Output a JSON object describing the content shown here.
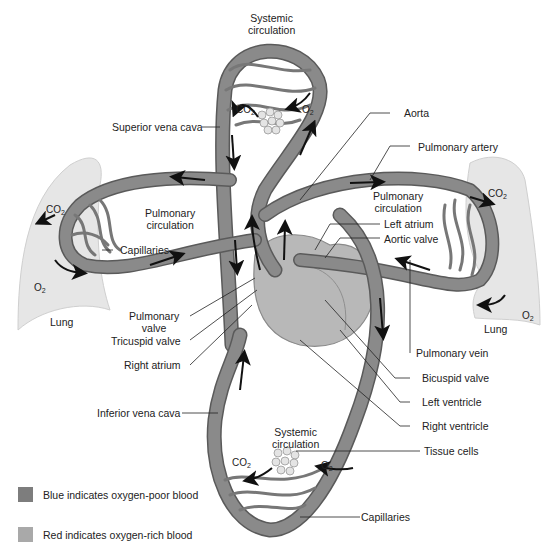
{
  "labels": {
    "systemic_top": [
      "Systemic",
      "circulation"
    ],
    "systemic_bottom": [
      "Systemic",
      "circulation"
    ],
    "pulmonary_left": [
      "Pulmonary",
      "circulation"
    ],
    "pulmonary_right": [
      "Pulmonary",
      "circulation"
    ],
    "superior_vena_cava": "Superior vena cava",
    "aorta": "Aorta",
    "pulmonary_artery": "Pulmonary artery",
    "capillaries_lung": "Capillaries",
    "left_atrium": "Left atrium",
    "aortic_valve": "Aortic valve",
    "pulmonary_valve": [
      "Pulmonary",
      "valve"
    ],
    "tricuspid_valve": "Tricuspid valve",
    "right_atrium": "Right atrium",
    "pulmonary_vein": "Pulmonary vein",
    "bicuspid_valve": "Bicuspid valve",
    "left_ventricle": "Left ventricle",
    "right_ventricle": "Right ventricle",
    "inferior_vena_cava": "Inferior vena cava",
    "tissue_cells": "Tissue cells",
    "capillaries_systemic": "Capillaries",
    "lung_left": "Lung",
    "lung_right": "Lung"
  },
  "gases": {
    "co2": "CO",
    "co2_sub": "2",
    "o2": "O",
    "o2_sub": "2"
  },
  "legend": [
    {
      "label": "Blue indicates oxygen-poor blood",
      "color": "#7d7d7d"
    },
    {
      "label": "Red indicates oxygen-rich blood",
      "color": "#a9a9a9"
    }
  ],
  "colors": {
    "vessel_poor": "#7a7a7a",
    "vessel_rich": "#9a9a9a",
    "vessel_edge": "#5a5a5a",
    "lung_fill": "#e6e6e6",
    "heart_fill": "#b8b8b8",
    "arrow": "#111111"
  }
}
